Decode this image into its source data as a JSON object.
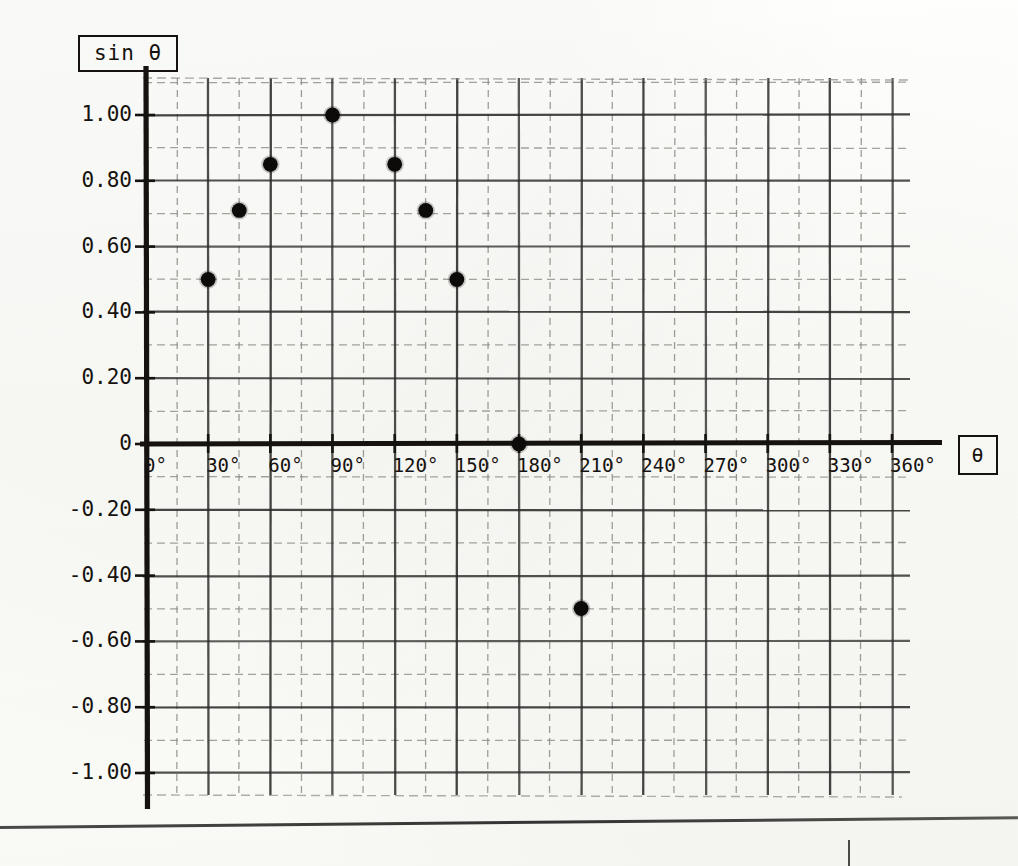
{
  "figure": {
    "kind": "scanned-graph-paper-plot",
    "y_axis_label": "sin θ",
    "x_axis_label": "θ"
  },
  "chart_data": {
    "type": "scatter",
    "title": "",
    "subtitle": "",
    "xlabel": "θ",
    "ylabel": "sin θ",
    "xlim": [
      0,
      360
    ],
    "ylim": [
      -1.2,
      1.2
    ],
    "grid": true,
    "legend": "none",
    "x_tick_labels": [
      "0°",
      "30°",
      "60°",
      "90°",
      "120°",
      "150°",
      "180°",
      "210°",
      "240°",
      "270°",
      "300°",
      "330°",
      "360°"
    ],
    "x_tick_values": [
      0,
      30,
      60,
      90,
      120,
      150,
      180,
      210,
      240,
      270,
      300,
      330,
      360
    ],
    "y_tick_labels": [
      "1.00",
      "0.80",
      "0.60",
      "0.40",
      "0.20",
      "0",
      "-0.20",
      "-0.40",
      "-0.60",
      "-0.80",
      "-1.00"
    ],
    "y_tick_values": [
      1.0,
      0.8,
      0.6,
      0.4,
      0.2,
      0,
      -0.2,
      -0.4,
      -0.6,
      -0.8,
      -1.0
    ],
    "x_major_step": 30,
    "y_major_step": 0.2,
    "y_minor_step": 0.1,
    "x_minor_step": 15,
    "points": [
      {
        "x": 30,
        "y": 0.5
      },
      {
        "x": 45,
        "y": 0.71
      },
      {
        "x": 60,
        "y": 0.85
      },
      {
        "x": 90,
        "y": 1.0
      },
      {
        "x": 120,
        "y": 0.85
      },
      {
        "x": 135,
        "y": 0.71
      },
      {
        "x": 150,
        "y": 0.5
      },
      {
        "x": 180,
        "y": 0.0
      },
      {
        "x": 210,
        "y": -0.5
      }
    ]
  },
  "colors": {
    "ink": "#15120f",
    "grid_major": "#2a2a28",
    "grid_minor": "#8d8d88",
    "paper": "#fbfbf8"
  }
}
